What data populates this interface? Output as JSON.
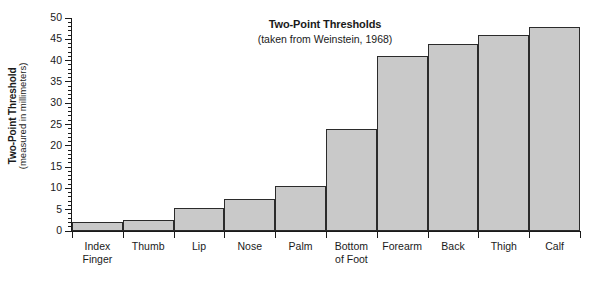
{
  "chart_data": {
    "type": "bar",
    "title": "Two-Point Thresholds",
    "subtitle": "(taken from Weinstein, 1968)",
    "xlabel": "",
    "ylabel": "Two-Point Threshold",
    "ylabel_sub": "(measured in millimeters)",
    "ylim": [
      0,
      50
    ],
    "ytick_step": 5,
    "yminor_step": 1,
    "grid": false,
    "legend": "none",
    "bar_fill": "#c9c9c9",
    "bar_stroke": "#2b2b2b",
    "categories": [
      "Index\nFinger",
      "Thumb",
      "Lip",
      "Nose",
      "Palm",
      "Bottom\nof Foot",
      "Forearm",
      "Back",
      "Thigh",
      "Calf"
    ],
    "values": [
      2,
      2.5,
      5.5,
      7.5,
      10.5,
      24,
      41,
      44,
      46,
      48
    ],
    "ytick_labels": [
      "0",
      "5",
      "10",
      "15",
      "20",
      "25",
      "30",
      "35",
      "40",
      "45",
      "50"
    ],
    "ytick_values": [
      0,
      5,
      10,
      15,
      20,
      25,
      30,
      35,
      40,
      45,
      50
    ]
  }
}
